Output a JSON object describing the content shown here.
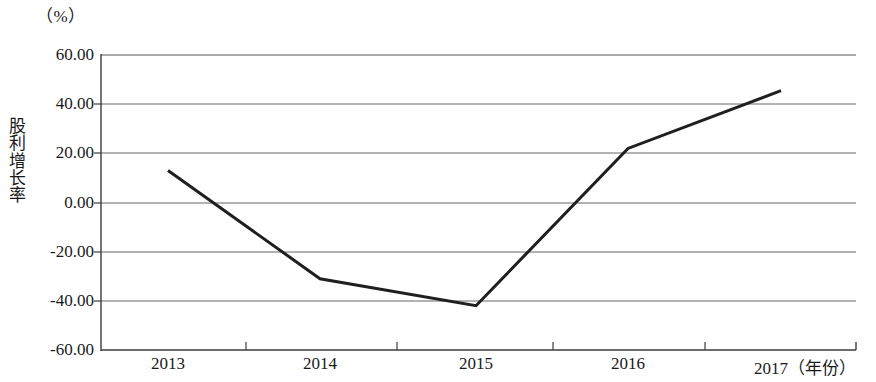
{
  "chart_data": {
    "type": "line",
    "title": "",
    "unit_label": "（%）",
    "ylabel": "股利增长率",
    "xlabel": "（年份）",
    "categories": [
      "2013",
      "2014",
      "2015",
      "2016",
      "2017"
    ],
    "values": [
      13.0,
      -31.0,
      -42.0,
      22.0,
      45.5
    ],
    "series": [
      {
        "name": "股利增长率",
        "values": [
          13.0,
          -31.0,
          -42.0,
          22.0,
          45.5
        ]
      }
    ],
    "ylim": [
      -60.0,
      60.0
    ],
    "ytick_labels": [
      "60.00",
      "40.00",
      "20.00",
      "0.00",
      "-20.00",
      "-40.00",
      "-60.00"
    ],
    "ytick_values": [
      60.0,
      40.0,
      20.0,
      0.0,
      -20.0,
      -40.0,
      -60.0
    ],
    "xtick_labels": [
      "2013",
      "2014",
      "2015",
      "2016",
      "2017"
    ],
    "grid": true,
    "legend": false,
    "legend_position": "none",
    "line_color": "#1f1f1f",
    "grid_color": "#6e6e6e",
    "axis_color": "#4a4a4a",
    "background_color": "#ffffff"
  },
  "axis": {
    "unit": "（%）",
    "y_title": "股利增长率",
    "x_unit_suffix": "（年份）"
  },
  "ticks": {
    "y": [
      {
        "label": "60.00",
        "value": 60.0
      },
      {
        "label": "40.00",
        "value": 40.0
      },
      {
        "label": "20.00",
        "value": 20.0
      },
      {
        "label": "0.00",
        "value": 0.0
      },
      {
        "label": "-20.00",
        "value": -20.0
      },
      {
        "label": "-40.00",
        "value": -40.0
      },
      {
        "label": "-60.00",
        "value": -60.0
      }
    ],
    "x": [
      {
        "label": "2013"
      },
      {
        "label": "2014"
      },
      {
        "label": "2015"
      },
      {
        "label": "2016"
      },
      {
        "label": "2017（年份）"
      }
    ]
  }
}
